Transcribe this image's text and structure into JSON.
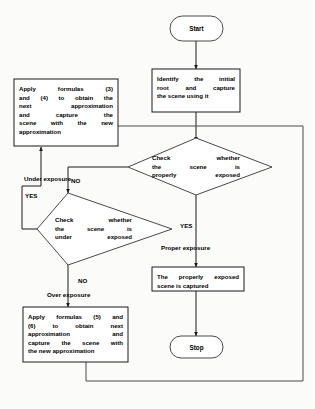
{
  "diagram": {
    "type": "flowchart",
    "stroke_color": "#1a1a1a",
    "fill_color": "#ffffff",
    "text_color": "#000000",
    "background_color": "#fbfbfa"
  },
  "nodes": {
    "start": {
      "shape": "terminator",
      "label": "Start"
    },
    "identify_root": {
      "shape": "process",
      "label": "Identify the initial root and capture the scene using it",
      "lines": [
        "Identify  the  initial",
        "root   and   capture",
        "the scene using it"
      ]
    },
    "apply_3_4": {
      "shape": "process",
      "label": "Apply formulas (3) and (4) to obtain the next approximation and capture the scene with the new approximation",
      "lines": [
        "Apply   formulas   (3)",
        "and (4) to obtain the",
        "next    approximation",
        "and    capture    the",
        "scene  with  the  new",
        "approximation"
      ]
    },
    "check_properly_exposed": {
      "shape": "decision",
      "label": "Check whether the scene is properly exposed",
      "lines": [
        "Check    whether",
        "the    scene    is",
        "properly exposed"
      ]
    },
    "check_under_exposed": {
      "shape": "decision",
      "label": "Check whether the scene is under exposed",
      "lines": [
        "Check  whether",
        "the   scene   is",
        "under  exposed"
      ]
    },
    "apply_5_6": {
      "shape": "process",
      "label": "Apply formulas (5) and (6) to obtain next approximation and capture the scene with the new approximation",
      "lines": [
        "Apply formulas (5) and",
        "(6)   to   obtain   next",
        "approximation      and",
        "capture the scene with",
        "the new approximation"
      ]
    },
    "properly_exposed_captured": {
      "shape": "process",
      "label": "The properly exposed scene is captured",
      "lines": [
        "The properly exposed",
        "scene is captured"
      ]
    },
    "stop": {
      "shape": "terminator",
      "label": "Stop"
    }
  },
  "edge_labels": {
    "no_to_under_check": "NO",
    "yes_under_exposure": "YES",
    "under_exposure": "Under exposure",
    "yes_proper": "YES",
    "proper_exposure": "Proper exposure",
    "no_over": "NO",
    "over_exposure": "Over exposure"
  }
}
